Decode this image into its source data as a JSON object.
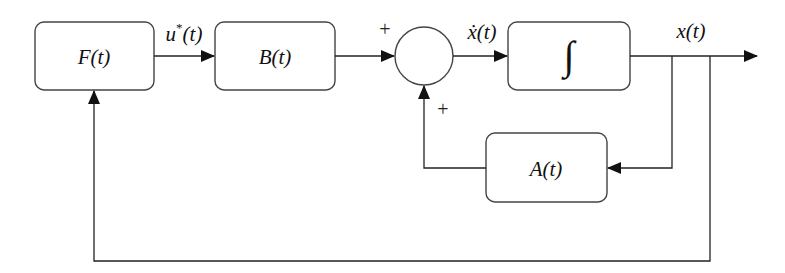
{
  "diagram": {
    "type": "control-system-block-diagram",
    "blocks": [
      {
        "id": "F",
        "label": "F(t)"
      },
      {
        "id": "B",
        "label": "B(t)"
      },
      {
        "id": "integrator",
        "label": "∫"
      },
      {
        "id": "A",
        "label": "A(t)"
      }
    ],
    "summing_junction": {
      "inputs": [
        "B(t) output",
        "A(t) output"
      ],
      "signs": [
        "+",
        "+"
      ]
    },
    "signals": {
      "control": "u",
      "control_sup": "*",
      "control_arg": "(t)",
      "state_derivative": "ẋ(t)",
      "state": "x(t)"
    },
    "signs": {
      "top": "+",
      "bottom": "+"
    },
    "connections": [
      {
        "from": "F",
        "to": "B",
        "signal": "u*(t)"
      },
      {
        "from": "B",
        "to": "summing_junction",
        "sign": "+"
      },
      {
        "from": "summing_junction",
        "to": "integrator",
        "signal": "ẋ(t)"
      },
      {
        "from": "integrator",
        "to": "output",
        "signal": "x(t)"
      },
      {
        "from": "output",
        "to": "A",
        "type": "feedback"
      },
      {
        "from": "A",
        "to": "summing_junction",
        "sign": "+"
      },
      {
        "from": "output",
        "to": "F",
        "type": "feedback"
      }
    ]
  }
}
